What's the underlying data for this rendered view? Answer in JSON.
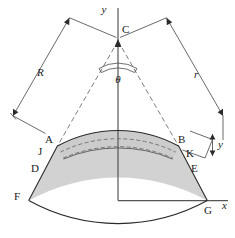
{
  "figure": {
    "labels": {
      "axis_y": "y",
      "axis_x": "x",
      "apex": "C",
      "angle": "θ",
      "radius_outer_left": "R",
      "radius_outer_right": "r",
      "point_A": "A",
      "point_B": "B",
      "point_J": "J",
      "point_K": "K",
      "point_D": "D",
      "point_E": "E",
      "point_F": "F",
      "point_G": "G",
      "offset_y": "y"
    },
    "colors": {
      "band_fill": "#d2d2d2",
      "outline": "#2b2b2b",
      "axis": "#555555",
      "dashed": "#777777",
      "background": "#ffffff"
    },
    "geometry": {
      "apex_x": 118,
      "apex_y": 37,
      "half_angle_deg": 29,
      "radius_outer_arc": 125,
      "radius_mid_arc": 140,
      "radius_inner_arc": 185,
      "dashed_arc_1": 131,
      "dashed_arc_2": 137
    }
  }
}
